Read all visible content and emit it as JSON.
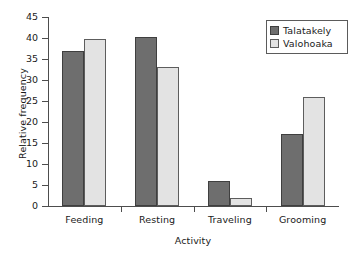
{
  "chart_data": {
    "type": "bar",
    "title": "",
    "xlabel": "Activity",
    "ylabel": "Relative frequency",
    "categories": [
      "Feeding",
      "Resting",
      "Traveling",
      "Grooming"
    ],
    "series": [
      {
        "name": "Talatakely",
        "color": "#6e6e6e",
        "values": [
          36.8,
          40.3,
          6.0,
          17.2
        ]
      },
      {
        "name": "Valohoaka",
        "color": "#e3e3e3",
        "values": [
          39.8,
          33.1,
          1.8,
          25.9
        ]
      }
    ],
    "ylim": [
      0,
      45
    ],
    "ytick_step": 5,
    "yticks": [
      0,
      5,
      10,
      15,
      20,
      25,
      30,
      35,
      40,
      45
    ],
    "ytick_labels": [
      "0",
      "5",
      "10",
      "15",
      "20",
      "25",
      "30",
      "35",
      "40",
      "45"
    ],
    "grid": false,
    "legend_position": "top-right"
  },
  "legend": {
    "items": [
      {
        "label": "Talatakely",
        "swatch": "dark-gray-swatch"
      },
      {
        "label": "Valohoaka",
        "swatch": "light-gray-swatch"
      }
    ]
  }
}
